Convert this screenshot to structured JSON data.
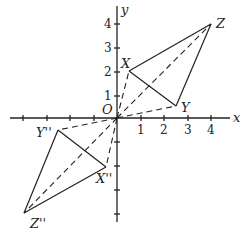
{
  "figure": {
    "axes": {
      "x_label": "x",
      "y_label": "y",
      "origin_label": "O",
      "x_ticks": [
        "1",
        "2",
        "3",
        "4"
      ],
      "y_ticks": [
        "1",
        "2",
        "3",
        "4"
      ]
    },
    "points": {
      "X": {
        "label": "X",
        "coords": [
          0.5,
          2
        ]
      },
      "Y": {
        "label": "Y",
        "coords": [
          2.5,
          0.5
        ]
      },
      "Z": {
        "label": "Z",
        "coords": [
          4,
          4
        ]
      },
      "X2": {
        "label": "X''",
        "coords": [
          -0.5,
          -2
        ]
      },
      "Y2": {
        "label": "Y''",
        "coords": [
          -2.5,
          -0.5
        ]
      },
      "Z2": {
        "label": "Z''",
        "coords": [
          -4,
          -4
        ]
      }
    }
  }
}
